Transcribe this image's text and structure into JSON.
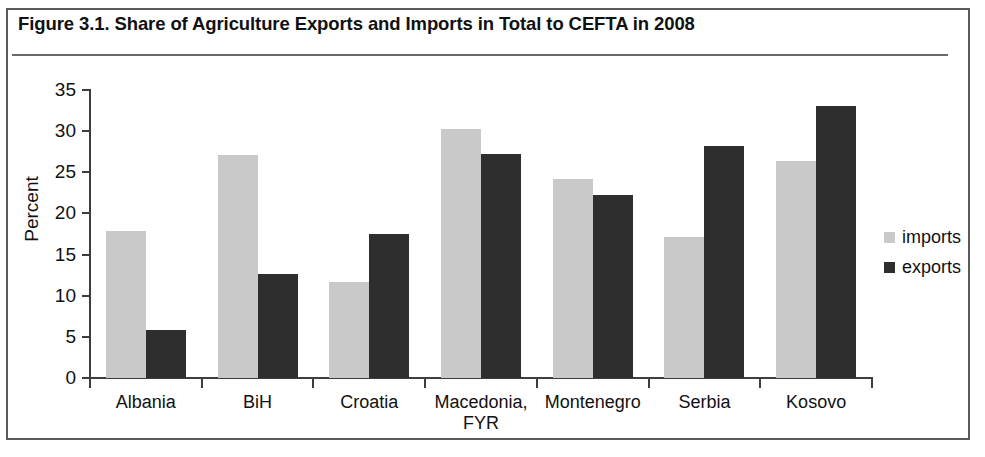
{
  "figure": {
    "title": "Figure 3.1. Share of Agriculture Exports and Imports in Total to CEFTA in 2008"
  },
  "legend": {
    "position": "right",
    "entries": [
      {
        "label": "imports",
        "color": "#c9c9c9",
        "icon": "square-swatch-icon"
      },
      {
        "label": "exports",
        "color": "#2e2e2e",
        "icon": "square-swatch-icon"
      }
    ]
  },
  "axes": {
    "ylabel": "Percent",
    "yticks": [
      "0",
      "5",
      "10",
      "15",
      "20",
      "25",
      "30",
      "35"
    ],
    "xlabel": ""
  },
  "chart_data": {
    "type": "bar",
    "title": "Figure 3.1. Share of Agriculture Exports and Imports in Total to CEFTA in 2008",
    "xlabel": "",
    "ylabel": "Percent",
    "ylim": [
      0,
      35
    ],
    "ytick_step": 5,
    "grid": false,
    "legend_position": "right",
    "categories": [
      "Albania",
      "BiH",
      "Croatia",
      "Macedonia, FYR",
      "Montenegro",
      "Serbia",
      "Kosovo"
    ],
    "category_lines": [
      [
        "Albania"
      ],
      [
        "BiH"
      ],
      [
        "Croatia"
      ],
      [
        "Macedonia,",
        "FYR"
      ],
      [
        "Montenegro"
      ],
      [
        "Serbia"
      ],
      [
        "Kosovo"
      ]
    ],
    "series": [
      {
        "name": "imports",
        "color": "#c9c9c9",
        "values": [
          17.9,
          27.1,
          11.7,
          30.3,
          24.2,
          17.1,
          26.4
        ]
      },
      {
        "name": "exports",
        "color": "#2e2e2e",
        "values": [
          5.8,
          12.7,
          17.5,
          27.2,
          22.2,
          28.2,
          33.0
        ]
      }
    ]
  }
}
